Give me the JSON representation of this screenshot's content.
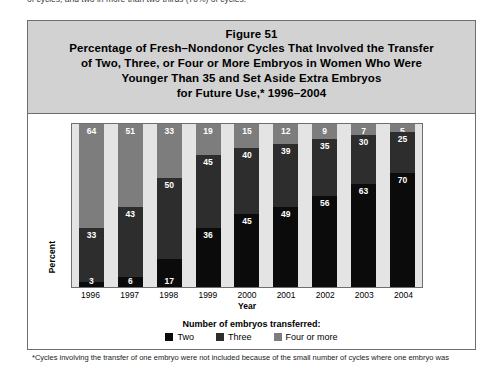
{
  "page": {
    "top_cut_text": "of cycles, and two in more than two-thirds (70%) of cycles."
  },
  "figure": {
    "number_label": "Figure 51",
    "title_lines": [
      "Percentage of Fresh–Nondonor Cycles That Involved the Transfer",
      "of Two, Three, or Four or More Embryos in Women Who Were",
      "Younger Than 35 and Set Aside Extra Embryos",
      "for Future Use,* 1996–2004"
    ],
    "footnote": "*Cycles involving the transfer of one embryo were not included because of the small number of cycles where one embryo was"
  },
  "legend": {
    "title": "Number of embryos transferred:",
    "items": [
      {
        "label": "Two",
        "color": "#0b0b0b"
      },
      {
        "label": "Three",
        "color": "#2d2d2d"
      },
      {
        "label": "Four or more",
        "color": "#7d7d7d"
      }
    ]
  },
  "chart_data": {
    "type": "bar",
    "subtype": "stacked-100-percent",
    "xlabel": "Year",
    "ylabel": "Percent",
    "ylim": [
      0,
      100
    ],
    "grid": false,
    "legend_position": "bottom",
    "categories": [
      "1996",
      "1997",
      "1998",
      "1999",
      "2000",
      "2001",
      "2002",
      "2003",
      "2004"
    ],
    "series": [
      {
        "name": "Two",
        "color": "#0b0b0b",
        "values": [
          3,
          6,
          17,
          36,
          45,
          49,
          56,
          63,
          70
        ]
      },
      {
        "name": "Three",
        "color": "#2d2d2d",
        "values": [
          33,
          43,
          50,
          45,
          40,
          39,
          35,
          30,
          25
        ]
      },
      {
        "name": "Four or more",
        "color": "#7d7d7d",
        "values": [
          64,
          51,
          33,
          19,
          15,
          12,
          9,
          7,
          5
        ]
      }
    ],
    "stack_order_bottom_to_top": [
      "Two",
      "Three",
      "Four or more"
    ]
  }
}
